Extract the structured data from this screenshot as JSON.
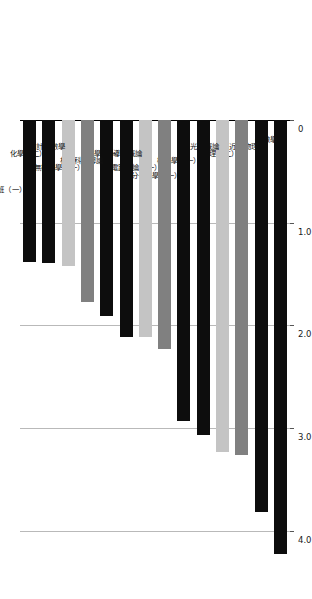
{
  "figure": {
    "orientation": "rotated-90-clockwise",
    "background_color": "#ffffff",
    "grid_color": "#b9b9b9",
    "axis_color": "#000000"
  },
  "palette": {
    "black": "#0d0d0d",
    "gray": "#808080",
    "light_gray": "#c4c4c4"
  },
  "chart_data": {
    "type": "bar",
    "title": "",
    "subtitle": "",
    "xlabel": "",
    "ylabel": "",
    "orientation": "vertical",
    "grid": true,
    "legend": null,
    "ylim": [
      0,
      4.4
    ],
    "yticks": [
      "0",
      "1.0",
      "2.0",
      "3.0",
      "4.0"
    ],
    "ytick_values": [
      0,
      1.0,
      2.0,
      3.0,
      4.0
    ],
    "categories": [
      "代數學",
      "近代物理",
      "物理（二）",
      "光學概論",
      "機化學（一）",
      "高分子化學（一）",
      "電路理論（一）",
      "半導體概論",
      "化學（一）",
      "材料科學導論",
      "無機化學（一）",
      "計算數學",
      "化學（二）",
      "分析導論實驗班（一）"
    ],
    "values": [
      4.22,
      3.82,
      3.26,
      3.23,
      3.07,
      2.93,
      2.23,
      2.11,
      2.11,
      1.91,
      1.77,
      1.42,
      1.39,
      1.38
    ],
    "bar_colors": [
      "#0d0d0d",
      "#0d0d0d",
      "#808080",
      "#c4c4c4",
      "#0d0d0d",
      "#0d0d0d",
      "#808080",
      "#c4c4c4",
      "#0d0d0d",
      "#0d0d0d",
      "#808080",
      "#c4c4c4",
      "#0d0d0d",
      "#0d0d0d"
    ]
  }
}
